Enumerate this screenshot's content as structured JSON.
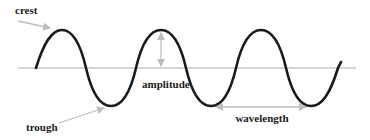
{
  "diagram": {
    "type": "wave-anatomy",
    "labels": {
      "crest": "crest",
      "trough": "trough",
      "amplitude": "amplitude",
      "wavelength": "wavelength"
    },
    "colors": {
      "wave": "#1a1a1a",
      "axis": "#c8c8c8",
      "arrow": "#bdbdbd",
      "text": "#1a1a1a",
      "background": "#ffffff"
    },
    "wave": {
      "cycles": 3,
      "crest_count": 3,
      "trough_count": 3
    }
  }
}
